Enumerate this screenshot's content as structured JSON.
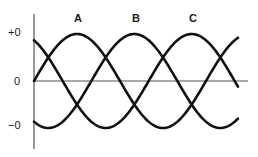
{
  "chart_data": {
    "type": "line",
    "title": "",
    "xlabel": "",
    "ylabel": "",
    "grid": false,
    "y_ticks": [
      {
        "label": "+0",
        "value": 1
      },
      {
        "label": "0",
        "value": 0
      },
      {
        "label": "−0",
        "value": -1
      }
    ],
    "series": [
      {
        "name": "A",
        "type": "sine",
        "amplitude": 1,
        "phase_deg": 0,
        "label_x_frac": 0.26
      },
      {
        "name": "B",
        "type": "sine",
        "amplitude": 1,
        "phase_deg": -120,
        "label_x_frac": 0.54
      },
      {
        "name": "C",
        "type": "sine",
        "amplitude": 1,
        "phase_deg": -240,
        "label_x_frac": 0.8
      }
    ],
    "x_range_periods": 1.18,
    "ylim": [
      -1,
      1
    ],
    "stroke_color": "#111111",
    "axis_color": "#555555"
  }
}
